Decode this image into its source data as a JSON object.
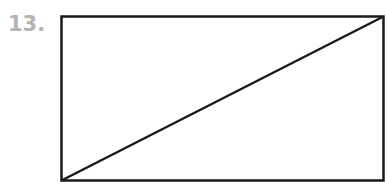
{
  "problem": {
    "number_label": "13."
  },
  "figure": {
    "shape": "rectangle",
    "diagonal": "bottom-left to top-right",
    "stroke_color": "#1a1a1a",
    "rect": {
      "x": 61,
      "y": 16,
      "width": 323,
      "height": 165
    },
    "diagonal_line": {
      "x1": 61,
      "y1": 181,
      "x2": 384,
      "y2": 16
    }
  }
}
